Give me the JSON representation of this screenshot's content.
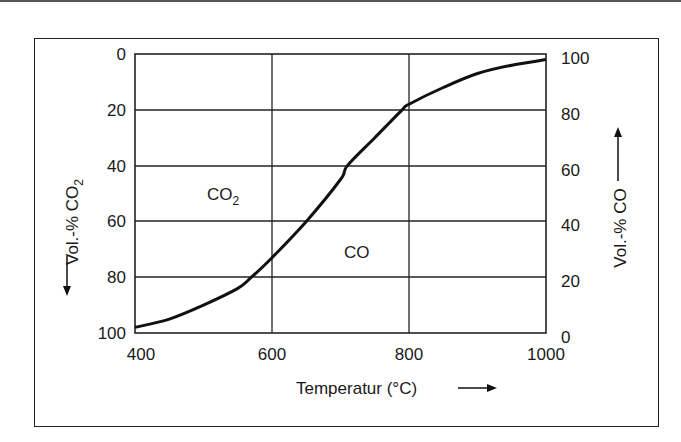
{
  "chart_data": {
    "type": "line",
    "title": "",
    "xlabel": "Temperatur (°C)",
    "ylabel_left": "Vol.-% CO2",
    "ylabel_right": "Vol.-% CO",
    "xlim": [
      400,
      1000
    ],
    "ylim_left": [
      100,
      0
    ],
    "ylim_right": [
      0,
      100
    ],
    "x_ticks": [
      "400",
      "600",
      "800",
      "1000"
    ],
    "y_left_ticks": [
      "0",
      "20",
      "40",
      "60",
      "80",
      "100"
    ],
    "y_right_ticks": [
      "100",
      "80",
      "60",
      "40",
      "20",
      "0"
    ],
    "grid": true,
    "region_labels": [
      "CO2",
      "CO"
    ],
    "series": [
      {
        "name": "CO / CO2 equilibrium (Boudouard)",
        "x": [
          400,
          450,
          500,
          550,
          570,
          600,
          650,
          700,
          710,
          750,
          790,
          800,
          850,
          900,
          950,
          1000
        ],
        "co_percent": [
          2,
          5,
          10,
          16,
          20,
          27,
          40,
          55,
          60,
          70,
          80,
          82,
          88,
          93,
          96,
          98
        ],
        "co2_percent": [
          98,
          95,
          90,
          84,
          80,
          73,
          60,
          45,
          40,
          30,
          20,
          18,
          12,
          7,
          4,
          2
        ]
      }
    ]
  },
  "labels": {
    "x_axis": "Temperatur (°C)",
    "y_left_prefix": "Vol.-% CO",
    "y_left_sub": "2",
    "y_right": "Vol.-% CO",
    "region_co2": "CO",
    "region_co2_sub": "2",
    "region_co": "CO"
  },
  "ticks": {
    "x": [
      "400",
      "600",
      "800",
      "1000"
    ],
    "left": [
      "0",
      "20",
      "40",
      "60",
      "80",
      "100"
    ],
    "right": [
      "100",
      "80",
      "60",
      "40",
      "20",
      "0"
    ]
  }
}
